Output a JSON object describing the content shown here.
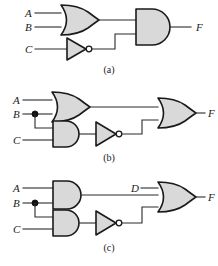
{
  "figure": {
    "colors": {
      "gate_fill": "#d9d9d9",
      "gate_outline": "#1a1a1a",
      "wire": "#2b2b2b",
      "bubble_fill": "#ffffff",
      "junction_dot": "#111111",
      "background": "#ffffff"
    }
  },
  "circuits": [
    {
      "id": "a",
      "caption": "(a)",
      "inputs": [
        {
          "name": "A",
          "label": "A"
        },
        {
          "name": "B",
          "label": "B"
        },
        {
          "name": "C",
          "label": "C"
        }
      ],
      "output": {
        "name": "F",
        "label": "F"
      },
      "gates": [
        {
          "name": "or-gate-ab",
          "type": "OR",
          "inputs": [
            "A",
            "B"
          ]
        },
        {
          "name": "not-gate-c",
          "type": "NOT",
          "inputs": [
            "C"
          ]
        },
        {
          "name": "and-gate-out",
          "type": "AND",
          "inputs": [
            "or-gate-ab",
            "not-gate-c"
          ]
        }
      ],
      "expression": "F = (A + B) · C'"
    },
    {
      "id": "b",
      "caption": "(b)",
      "inputs": [
        {
          "name": "A",
          "label": "A"
        },
        {
          "name": "B",
          "label": "B"
        },
        {
          "name": "C",
          "label": "C"
        }
      ],
      "output": {
        "name": "F",
        "label": "F"
      },
      "gates": [
        {
          "name": "or-gate-ab",
          "type": "OR",
          "inputs": [
            "A",
            "B"
          ]
        },
        {
          "name": "and-gate-bc",
          "type": "AND",
          "inputs": [
            "B",
            "C"
          ]
        },
        {
          "name": "not-gate-bc",
          "type": "NOT",
          "inputs": [
            "and-gate-bc"
          ]
        },
        {
          "name": "or-gate-out",
          "type": "OR",
          "inputs": [
            "or-gate-ab",
            "not-gate-bc"
          ]
        }
      ],
      "junctions": [
        {
          "name": "junction-b",
          "on_signal": "B"
        }
      ],
      "expression": "F = (A + B) + (B · C)'"
    },
    {
      "id": "c",
      "caption": "(c)",
      "inputs": [
        {
          "name": "A",
          "label": "A"
        },
        {
          "name": "B",
          "label": "B"
        },
        {
          "name": "C",
          "label": "C"
        },
        {
          "name": "D",
          "label": "D"
        }
      ],
      "output": {
        "name": "F",
        "label": "F"
      },
      "gates": [
        {
          "name": "and-gate-ab",
          "type": "AND",
          "inputs": [
            "A",
            "B"
          ]
        },
        {
          "name": "and-gate-bc",
          "type": "AND",
          "inputs": [
            "B",
            "C"
          ]
        },
        {
          "name": "not-gate-bc",
          "type": "NOT",
          "inputs": [
            "and-gate-bc"
          ]
        },
        {
          "name": "or-gate-out",
          "type": "OR",
          "inputs": [
            "D",
            "and-gate-ab",
            "not-gate-bc"
          ]
        }
      ],
      "junctions": [
        {
          "name": "junction-b",
          "on_signal": "B"
        }
      ],
      "expression": "F = D + (A · B) + (B · C)'"
    }
  ]
}
